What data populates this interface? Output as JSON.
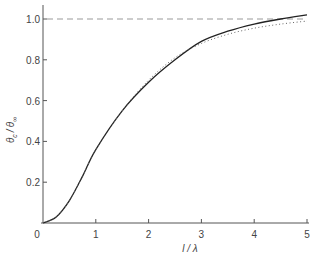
{
  "chart_data": {
    "type": "line",
    "title": "",
    "xlabel": "l / λ",
    "ylabel": "θc / θ∞",
    "xlim": [
      0,
      5
    ],
    "ylim": [
      0,
      1.05
    ],
    "grid": false,
    "legend": null,
    "x_ticks": [
      "0",
      "1",
      "2",
      "3",
      "4",
      "5"
    ],
    "y_ticks": [
      "0.2",
      "0.4",
      "0.6",
      "0.8",
      "1.0"
    ],
    "reference_line": {
      "style": "dashed",
      "y": 1.0
    },
    "series": [
      {
        "name": "solid",
        "style": "solid",
        "x": [
          0,
          0.25,
          0.5,
          0.75,
          1.0,
          1.5,
          2.0,
          2.5,
          3.0,
          3.5,
          4.0,
          4.5,
          5.0
        ],
        "values": [
          0,
          0.03,
          0.11,
          0.23,
          0.36,
          0.55,
          0.69,
          0.8,
          0.89,
          0.94,
          0.975,
          1.0,
          1.02
        ]
      },
      {
        "name": "dotted",
        "style": "dotted",
        "x": [
          0,
          0.25,
          0.5,
          0.75,
          1.0,
          1.5,
          2.0,
          2.5,
          3.0,
          3.5,
          4.0,
          4.5,
          5.0
        ],
        "values": [
          0,
          0.03,
          0.11,
          0.23,
          0.36,
          0.55,
          0.7,
          0.81,
          0.88,
          0.925,
          0.955,
          0.975,
          0.99
        ]
      }
    ]
  },
  "labels": {
    "origin": "0",
    "x_axis": "l / λ",
    "y_axis_theta_c": "θ",
    "y_axis_sub_c": "c",
    "y_axis_slash": "/",
    "y_axis_theta_inf": "θ",
    "y_axis_sub_inf": "∞"
  }
}
